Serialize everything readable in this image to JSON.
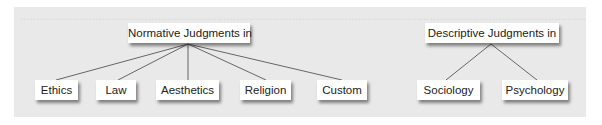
{
  "diagram": {
    "background_color": "#e9e9e9",
    "line_color": "#666666",
    "roots": [
      {
        "id": "normative",
        "label": "Normative Judgments in",
        "children": [
          "Ethics",
          "Law",
          "Aesthetics",
          "Religion",
          "Custom"
        ]
      },
      {
        "id": "descriptive",
        "label": "Descriptive Judgments in",
        "children": [
          "Sociology",
          "Psychology"
        ]
      }
    ],
    "nodes": {
      "normative": "Normative Judgments in",
      "descriptive": "Descriptive Judgments in",
      "ethics": "Ethics",
      "law": "Law",
      "aesthetics": "Aesthetics",
      "religion": "Religion",
      "custom": "Custom",
      "sociology": "Sociology",
      "psychology": "Psychology"
    }
  }
}
